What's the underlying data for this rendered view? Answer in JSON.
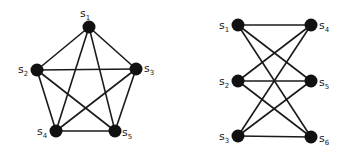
{
  "graphs": [
    {
      "name": "complete-graph-k5",
      "nodes": [
        {
          "id": "s1",
          "base": "s",
          "sub": "1",
          "x": 89,
          "y": 27,
          "lx": 80,
          "ly": 17
        },
        {
          "id": "s2",
          "base": "s",
          "sub": "2",
          "x": 37,
          "y": 70,
          "lx": 18,
          "ly": 73
        },
        {
          "id": "s3",
          "base": "s",
          "sub": "3",
          "x": 136,
          "y": 69,
          "lx": 144,
          "ly": 72
        },
        {
          "id": "s4",
          "base": "s",
          "sub": "4",
          "x": 56,
          "y": 131,
          "lx": 37,
          "ly": 135
        },
        {
          "id": "s5",
          "base": "s",
          "sub": "5",
          "x": 115,
          "y": 131,
          "lx": 122,
          "ly": 136
        }
      ],
      "edges": [
        [
          "s1",
          "s2"
        ],
        [
          "s1",
          "s3"
        ],
        [
          "s1",
          "s4"
        ],
        [
          "s1",
          "s5"
        ],
        [
          "s2",
          "s3"
        ],
        [
          "s2",
          "s4"
        ],
        [
          "s2",
          "s5"
        ],
        [
          "s3",
          "s4"
        ],
        [
          "s3",
          "s5"
        ],
        [
          "s4",
          "s5"
        ]
      ]
    },
    {
      "name": "complete-bipartite-graph-k33",
      "nodes": [
        {
          "id": "s1",
          "base": "s",
          "sub": "1",
          "x": 238,
          "y": 25,
          "lx": 219,
          "ly": 29
        },
        {
          "id": "s2",
          "base": "s",
          "sub": "2",
          "x": 238,
          "y": 81,
          "lx": 219,
          "ly": 85
        },
        {
          "id": "s3",
          "base": "s",
          "sub": "3",
          "x": 238,
          "y": 136,
          "lx": 219,
          "ly": 140
        },
        {
          "id": "s4",
          "base": "s",
          "sub": "4",
          "x": 311,
          "y": 25,
          "lx": 319,
          "ly": 29
        },
        {
          "id": "s5",
          "base": "s",
          "sub": "5",
          "x": 311,
          "y": 81,
          "lx": 319,
          "ly": 86
        },
        {
          "id": "s6",
          "base": "s",
          "sub": "6",
          "x": 311,
          "y": 137,
          "lx": 319,
          "ly": 142
        }
      ],
      "edges": [
        [
          "s1",
          "s4"
        ],
        [
          "s1",
          "s5"
        ],
        [
          "s1",
          "s6"
        ],
        [
          "s2",
          "s4"
        ],
        [
          "s2",
          "s5"
        ],
        [
          "s2",
          "s6"
        ],
        [
          "s3",
          "s4"
        ],
        [
          "s3",
          "s5"
        ],
        [
          "s3",
          "s6"
        ]
      ]
    }
  ],
  "style": {
    "node_radius": 6.5,
    "edge_color": "#1a1a1a",
    "node_color": "#111111"
  }
}
